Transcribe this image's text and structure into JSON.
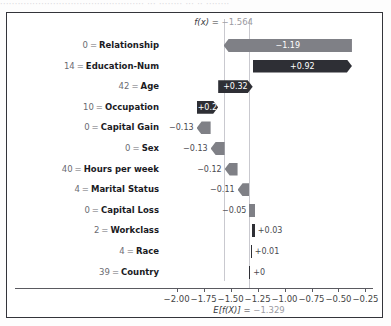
{
  "top_clip_text": "················································· ··· ········ ··· ·· ········",
  "figure": {
    "fx_annotation": {
      "label": "f(x)",
      "equals": "=",
      "value": "−1.564"
    },
    "expected_annotation": {
      "label": "E[f(X)]",
      "equals": "=",
      "value": "−1.329"
    }
  },
  "chart_data": {
    "type": "bar",
    "subtype": "shap-waterfall",
    "title": "",
    "xlabel": "",
    "ylabel": "",
    "xlim": [
      -2.08,
      -0.18
    ],
    "xticks": [
      -2.0,
      -1.75,
      -1.5,
      -1.25,
      -1.0,
      -0.75,
      -0.5,
      -0.25
    ],
    "xtick_labels": [
      "−2.00",
      "−1.75",
      "−1.50",
      "−1.25",
      "−1.00",
      "−0.75",
      "−0.50",
      "−0.25"
    ],
    "grid": false,
    "legend": null,
    "base_value": -1.329,
    "output_value": -1.564,
    "colors": {
      "positive": "#2e2f35",
      "negative": "#7f8086",
      "reference_line": "#c9c9cf"
    },
    "categories": [
      "0 = Relationship",
      "14 = Education-Num",
      "42 = Age",
      "10 = Occupation",
      "0 = Capital Gain",
      "0 = Sex",
      "40 = Hours per week",
      "4 = Marital Status",
      "0 = Capital Loss",
      "2 = Workclass",
      "4 = Race",
      "39 = Country"
    ],
    "values": [
      -1.19,
      0.92,
      0.32,
      0.2,
      -0.13,
      -0.13,
      -0.12,
      -0.11,
      -0.05,
      0.03,
      0.01,
      0.0
    ],
    "value_labels": [
      "−1.19",
      "+0.92",
      "+0.32",
      "+0.2",
      "−0.13",
      "−0.13",
      "−0.12",
      "−0.11",
      "−0.05",
      "+0.03",
      "+0.01",
      "+0"
    ],
    "rows": [
      {
        "feature": "Relationship",
        "feature_value": "0",
        "value": -1.19,
        "label": "−1.19",
        "direction": "negative",
        "label_inside": true,
        "start": -0.375,
        "end": -1.565
      },
      {
        "feature": "Education-Num",
        "feature_value": "14",
        "value": 0.92,
        "label": "+0.92",
        "direction": "positive",
        "label_inside": true,
        "start": -1.295,
        "end": -0.375
      },
      {
        "feature": "Age",
        "feature_value": "42",
        "value": 0.32,
        "label": "+0.32",
        "direction": "positive",
        "label_inside": true,
        "start": -1.615,
        "end": -1.295
      },
      {
        "feature": "Occupation",
        "feature_value": "10",
        "value": 0.2,
        "label": "+0.2",
        "direction": "positive",
        "label_inside": true,
        "start": -1.815,
        "end": -1.615
      },
      {
        "feature": "Capital Gain",
        "feature_value": "0",
        "value": -0.13,
        "label": "−0.13",
        "direction": "negative",
        "label_inside": false,
        "start": -1.685,
        "end": -1.815
      },
      {
        "feature": "Sex",
        "feature_value": "0",
        "value": -0.13,
        "label": "−0.13",
        "direction": "negative",
        "label_inside": false,
        "start": -1.555,
        "end": -1.685
      },
      {
        "feature": "Hours per week",
        "feature_value": "40",
        "value": -0.12,
        "label": "−0.12",
        "direction": "negative",
        "label_inside": false,
        "start": -1.435,
        "end": -1.555
      },
      {
        "feature": "Marital Status",
        "feature_value": "4",
        "value": -0.11,
        "label": "−0.11",
        "direction": "negative",
        "label_inside": false,
        "start": -1.325,
        "end": -1.435
      },
      {
        "feature": "Capital Loss",
        "feature_value": "0",
        "value": -0.05,
        "label": "−0.05",
        "direction": "negative",
        "label_inside": false,
        "start": -1.275,
        "end": -1.325
      },
      {
        "feature": "Workclass",
        "feature_value": "2",
        "value": 0.03,
        "label": "+0.03",
        "direction": "positive",
        "label_inside": false,
        "start": -1.305,
        "end": -1.275
      },
      {
        "feature": "Race",
        "feature_value": "4",
        "value": 0.01,
        "label": "+0.01",
        "direction": "positive",
        "label_inside": false,
        "start": -1.315,
        "end": -1.305
      },
      {
        "feature": "Country",
        "feature_value": "39",
        "value": 0.0,
        "label": "+0",
        "direction": "positive",
        "label_inside": false,
        "start": -1.329,
        "end": -1.329
      }
    ]
  }
}
